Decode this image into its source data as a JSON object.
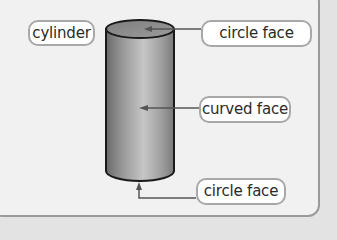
{
  "diagram": {
    "shape": "cylinder",
    "labels": {
      "shape_name": "cylinder",
      "top_face": "circle face",
      "side_face": "curved face",
      "bottom_face": "circle face"
    },
    "colors": {
      "panel_background": "#f1f1f1",
      "outer_background": "#e3e3e3",
      "panel_border": "#9a9a9a",
      "cylinder_dark": "#6e6e6e",
      "cylinder_light": "#c4c4c4",
      "cylinder_top": "#8a8a8a",
      "outline": "#1a1a1a",
      "arrow": "#555555",
      "label_border": "#a8a8a8",
      "label_text": "#2a2a2a"
    }
  }
}
